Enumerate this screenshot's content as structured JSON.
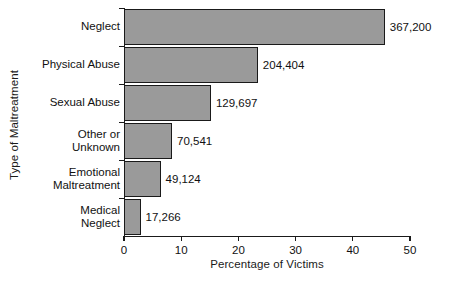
{
  "chart_data": {
    "type": "bar",
    "orientation": "horizontal",
    "title": "",
    "xlabel": "Percentage of Victims",
    "ylabel": "Type of Maltreatment",
    "categories": [
      "Neglect",
      "Physical Abuse",
      "Sexual Abuse",
      "Other or\nUnknown",
      "Emotional\nMaltreatment",
      "Medical\nNeglect"
    ],
    "values": [
      45.6,
      23.4,
      15.2,
      8.4,
      6.4,
      2.9
    ],
    "point_labels": [
      "367,200",
      "204,404",
      "129,697",
      "70,541",
      "49,124",
      "17,266"
    ],
    "xlim": [
      0,
      50
    ],
    "xticks": [
      0,
      10,
      20,
      30,
      40,
      50
    ],
    "xtick_labels": [
      "0",
      "10",
      "20",
      "30",
      "40",
      "50"
    ],
    "grid": false,
    "legend": null,
    "bar_color": "#9a9a9a",
    "bar_edge_color": "#1a1a1a"
  }
}
